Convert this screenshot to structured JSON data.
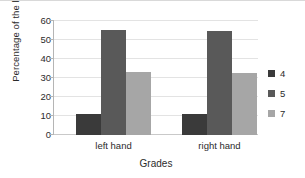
{
  "chart_data": {
    "type": "bar",
    "title": "",
    "xlabel": "Grades",
    "ylabel": "Percentage of the load (%)",
    "categories": [
      "left hand",
      "right hand"
    ],
    "series": [
      {
        "name": "4",
        "values": [
          11,
          11
        ],
        "color": "#3a3a3a"
      },
      {
        "name": "5",
        "values": [
          55.5,
          55
        ],
        "color": "#595959"
      },
      {
        "name": "7",
        "values": [
          33,
          32.5
        ],
        "color": "#a6a6a6"
      }
    ],
    "ylim": [
      0,
      60
    ],
    "yticks": [
      0,
      10,
      20,
      30,
      40,
      50,
      60
    ],
    "ytick_labels": [
      "0",
      "10",
      "20",
      "30",
      "40",
      "50",
      "60"
    ],
    "grid": {
      "horizontal": true,
      "vertical": false
    },
    "legend": {
      "position": "right",
      "entries": [
        "4",
        "5",
        "7"
      ]
    }
  }
}
